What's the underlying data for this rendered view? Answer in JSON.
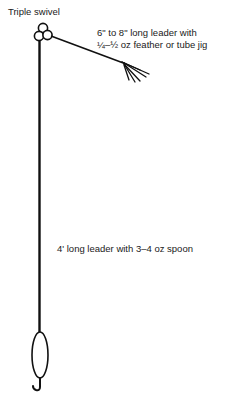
{
  "diagram": {
    "labels": {
      "swivel": "Triple swivel",
      "short_leader_line1": "6\" to 8\" long leader with",
      "short_leader_line2": "¼–½ oz feather or tube jig",
      "long_leader": "4' long leader with 3–4 oz spoon"
    },
    "components": [
      {
        "name": "triple-swivel",
        "type": "circles",
        "count": 3
      },
      {
        "name": "short-leader",
        "type": "line"
      },
      {
        "name": "feather-jig",
        "type": "lure"
      },
      {
        "name": "long-leader",
        "type": "line"
      },
      {
        "name": "spoon",
        "type": "lure"
      },
      {
        "name": "hook",
        "type": "hook"
      }
    ],
    "colors": {
      "stroke": "#111111",
      "background": "#ffffff"
    }
  }
}
